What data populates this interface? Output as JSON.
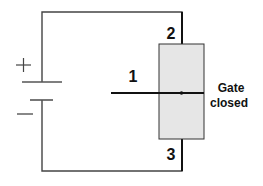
{
  "diagram": {
    "battery": {
      "plus_symbol": "+",
      "minus_symbol": "−"
    },
    "terminals": {
      "t1": "1",
      "t2": "2",
      "t3": "3"
    },
    "gate_label": {
      "line1": "Gate",
      "line2": "closed"
    },
    "colors": {
      "wire": "#1a1a1a",
      "box_fill": "#e6e6e6",
      "box_stroke": "#333333"
    }
  }
}
